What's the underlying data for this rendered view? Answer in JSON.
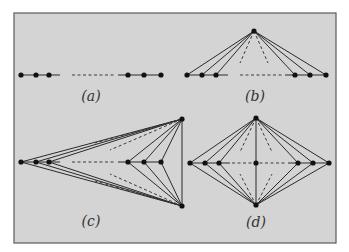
{
  "figure": {
    "background": "#d4d4d4",
    "border_color": "#5a5a5a",
    "ink_color": "#1a1a1a",
    "frame": {
      "x": 14,
      "y": 13,
      "w": 322,
      "h": 230
    }
  },
  "panels": [
    {
      "id": "a",
      "label": "(a)",
      "label_pos": [
        91,
        101
      ],
      "description": "path graph: three nodes, dashed gap, three nodes",
      "nodes": [
        [
          21,
          75
        ],
        [
          36,
          75
        ],
        [
          49,
          75
        ],
        [
          128,
          75
        ],
        [
          144,
          75
        ],
        [
          161,
          75
        ]
      ],
      "solid": [
        [
          [
            21,
            75
          ],
          [
            60,
            75
          ]
        ],
        [
          [
            118,
            75
          ],
          [
            161,
            75
          ]
        ]
      ],
      "dashed": [
        [
          [
            72,
            75
          ],
          [
            116,
            75
          ]
        ]
      ]
    },
    {
      "id": "b",
      "label": "(b)",
      "label_pos": [
        255,
        101
      ],
      "description": "fan graph: path plus apex joined to every path node",
      "nodes": [
        [
          254,
          31
        ],
        [
          187,
          75
        ],
        [
          202,
          75
        ],
        [
          216,
          75
        ],
        [
          295,
          75
        ],
        [
          310,
          75
        ],
        [
          326,
          75
        ]
      ],
      "solid": [
        [
          [
            187,
            75
          ],
          [
            228,
            75
          ]
        ],
        [
          [
            285,
            75
          ],
          [
            326,
            75
          ]
        ],
        [
          [
            254,
            31
          ],
          [
            187,
            75
          ]
        ],
        [
          [
            254,
            31
          ],
          [
            202,
            75
          ]
        ],
        [
          [
            254,
            31
          ],
          [
            216,
            75
          ]
        ],
        [
          [
            254,
            31
          ],
          [
            295,
            75
          ]
        ],
        [
          [
            254,
            31
          ],
          [
            310,
            75
          ]
        ],
        [
          [
            254,
            31
          ],
          [
            326,
            75
          ]
        ]
      ],
      "dashed": [
        [
          [
            240,
            75
          ],
          [
            282,
            75
          ]
        ],
        [
          [
            254,
            31
          ],
          [
            240,
            63
          ]
        ],
        [
          [
            254,
            31
          ],
          [
            268,
            63
          ]
        ]
      ]
    },
    {
      "id": "c",
      "label": "(c)",
      "label_pos": [
        91,
        226
      ],
      "description": "path with two apexes on the right, each joined to all path nodes, apexes joined",
      "nodes": [
        [
          21,
          162
        ],
        [
          36,
          162
        ],
        [
          49,
          162
        ],
        [
          128,
          162
        ],
        [
          144,
          162
        ],
        [
          161,
          162
        ],
        [
          182,
          119
        ],
        [
          182,
          206
        ]
      ],
      "solid": [
        [
          [
            21,
            162
          ],
          [
            60,
            162
          ]
        ],
        [
          [
            118,
            162
          ],
          [
            161,
            162
          ]
        ],
        [
          [
            182,
            119
          ],
          [
            182,
            206
          ]
        ],
        [
          [
            182,
            119
          ],
          [
            21,
            162
          ]
        ],
        [
          [
            182,
            119
          ],
          [
            36,
            162
          ]
        ],
        [
          [
            182,
            119
          ],
          [
            49,
            162
          ]
        ],
        [
          [
            182,
            119
          ],
          [
            128,
            162
          ]
        ],
        [
          [
            182,
            119
          ],
          [
            144,
            162
          ]
        ],
        [
          [
            182,
            119
          ],
          [
            161,
            162
          ]
        ],
        [
          [
            182,
            206
          ],
          [
            21,
            162
          ]
        ],
        [
          [
            182,
            206
          ],
          [
            36,
            162
          ]
        ],
        [
          [
            182,
            206
          ],
          [
            49,
            162
          ]
        ],
        [
          [
            182,
            206
          ],
          [
            128,
            162
          ]
        ],
        [
          [
            182,
            206
          ],
          [
            144,
            162
          ]
        ],
        [
          [
            182,
            206
          ],
          [
            161,
            162
          ]
        ]
      ],
      "dashed": [
        [
          [
            72,
            162
          ],
          [
            116,
            162
          ]
        ],
        [
          [
            182,
            119
          ],
          [
            95,
            143
          ]
        ],
        [
          [
            182,
            119
          ],
          [
            110,
            150
          ]
        ],
        [
          [
            182,
            206
          ],
          [
            95,
            181
          ]
        ],
        [
          [
            182,
            206
          ],
          [
            110,
            174
          ]
        ]
      ]
    },
    {
      "id": "d",
      "label": "(d)",
      "label_pos": [
        256,
        227
      ],
      "description": "double fan: top and bottom apexes joined to every path node and each other",
      "nodes": [
        [
          190,
          163
        ],
        [
          205,
          163
        ],
        [
          219,
          163
        ],
        [
          256,
          163
        ],
        [
          298,
          163
        ],
        [
          313,
          163
        ],
        [
          329,
          163
        ],
        [
          256,
          118
        ],
        [
          256,
          205
        ]
      ],
      "solid": [
        [
          [
            190,
            163
          ],
          [
            230,
            163
          ]
        ],
        [
          [
            288,
            163
          ],
          [
            329,
            163
          ]
        ],
        [
          [
            256,
            118
          ],
          [
            256,
            205
          ]
        ],
        [
          [
            256,
            118
          ],
          [
            190,
            163
          ]
        ],
        [
          [
            256,
            118
          ],
          [
            205,
            163
          ]
        ],
        [
          [
            256,
            118
          ],
          [
            219,
            163
          ]
        ],
        [
          [
            256,
            118
          ],
          [
            298,
            163
          ]
        ],
        [
          [
            256,
            118
          ],
          [
            313,
            163
          ]
        ],
        [
          [
            256,
            118
          ],
          [
            329,
            163
          ]
        ],
        [
          [
            256,
            205
          ],
          [
            190,
            163
          ]
        ],
        [
          [
            256,
            205
          ],
          [
            205,
            163
          ]
        ],
        [
          [
            256,
            205
          ],
          [
            219,
            163
          ]
        ],
        [
          [
            256,
            205
          ],
          [
            298,
            163
          ]
        ],
        [
          [
            256,
            205
          ],
          [
            313,
            163
          ]
        ],
        [
          [
            256,
            205
          ],
          [
            329,
            163
          ]
        ]
      ],
      "dashed": [
        [
          [
            232,
            163
          ],
          [
            286,
            163
          ]
        ],
        [
          [
            256,
            118
          ],
          [
            240,
            152
          ]
        ],
        [
          [
            256,
            118
          ],
          [
            272,
            152
          ]
        ],
        [
          [
            256,
            205
          ],
          [
            240,
            174
          ]
        ],
        [
          [
            256,
            205
          ],
          [
            272,
            174
          ]
        ]
      ]
    }
  ]
}
